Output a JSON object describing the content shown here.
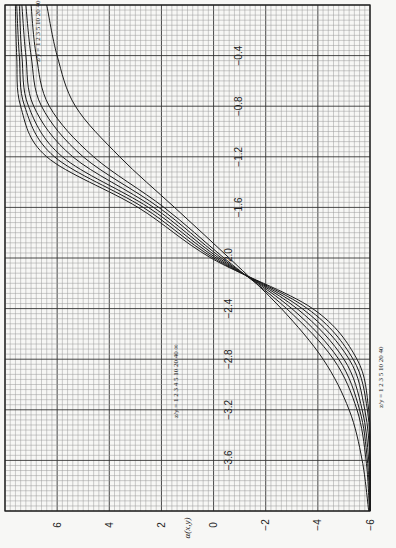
{
  "chart_data": {
    "type": "line",
    "orientation": "rotated-90-ccw",
    "title": "",
    "xlabel": "x",
    "ylabel": "α(x,y)",
    "xlim": [
      0,
      -4.0
    ],
    "ylim": [
      -6,
      8
    ],
    "x_ticks": [
      -0.4,
      -0.8,
      -1.2,
      -1.6,
      -2.0,
      -2.4,
      -2.8,
      -3.2,
      -3.6
    ],
    "x_tick_labels": [
      "−0.4",
      "−0.8",
      "−1.2",
      "−1.6",
      "−2.0",
      "−2.4",
      "−2.8",
      "−3.2",
      "−3.6"
    ],
    "y_ticks": [
      6,
      4,
      2,
      0,
      -2,
      -4,
      -6
    ],
    "y_tick_labels": [
      "6",
      "4",
      "2",
      "0",
      "−2",
      "−4",
      "−6"
    ],
    "grid": true,
    "legend_top": "z/y = 1  2  3  5  10  20  40",
    "legend_bottom": "z/y = 1  2  3  5  10  20  40",
    "legend_inner": "z/y = 1 2 3 4 5 10 20 40 ∞",
    "series": [
      {
        "name": "z/y=1",
        "x": [
          0,
          -0.4,
          -0.8,
          -1.2,
          -1.6,
          -2.0,
          -2.4,
          -2.8,
          -3.2,
          -3.6,
          -4.0
        ],
        "values": [
          6.4,
          6.0,
          5.3,
          3.6,
          1.5,
          -0.6,
          -2.6,
          -4.2,
          -5.2,
          -5.7,
          -5.95
        ]
      },
      {
        "name": "z/y=2",
        "x": [
          0,
          -0.4,
          -0.8,
          -1.2,
          -1.6,
          -2.0,
          -2.4,
          -2.8,
          -3.2,
          -3.6,
          -4.0
        ],
        "values": [
          7.0,
          6.8,
          6.3,
          4.6,
          1.9,
          -0.4,
          -2.8,
          -4.6,
          -5.5,
          -5.85,
          -5.98
        ]
      },
      {
        "name": "z/y=3",
        "x": [
          0,
          -0.4,
          -0.8,
          -1.2,
          -1.6,
          -2.0,
          -2.4,
          -2.8,
          -3.2,
          -3.6,
          -4.0
        ],
        "values": [
          7.2,
          7.0,
          6.6,
          5.0,
          2.1,
          -0.3,
          -3.0,
          -4.8,
          -5.6,
          -5.9,
          -6.0
        ]
      },
      {
        "name": "z/y=5",
        "x": [
          0,
          -0.4,
          -0.8,
          -1.2,
          -1.6,
          -2.0,
          -2.4,
          -2.8,
          -3.2,
          -3.6,
          -4.0
        ],
        "values": [
          7.35,
          7.2,
          6.9,
          5.4,
          2.3,
          -0.2,
          -3.2,
          -5.0,
          -5.7,
          -5.95,
          -6.0
        ]
      },
      {
        "name": "z/y=10",
        "x": [
          0,
          -0.4,
          -0.8,
          -1.2,
          -1.6,
          -2.0,
          -2.4,
          -2.8,
          -3.2,
          -3.6,
          -4.0
        ],
        "values": [
          7.45,
          7.35,
          7.1,
          5.8,
          2.5,
          -0.1,
          -3.4,
          -5.2,
          -5.8,
          -6.0,
          -6.0
        ]
      },
      {
        "name": "z/y=20",
        "x": [
          0,
          -0.4,
          -0.8,
          -1.2,
          -1.6,
          -2.0,
          -2.4,
          -2.8,
          -3.2,
          -3.6,
          -4.0
        ],
        "values": [
          7.55,
          7.45,
          7.25,
          6.1,
          2.7,
          0.0,
          -3.6,
          -5.35,
          -5.9,
          -6.0,
          -6.0
        ]
      },
      {
        "name": "z/y=40",
        "x": [
          0,
          -0.4,
          -0.8,
          -1.2,
          -1.6,
          -2.0,
          -2.4,
          -2.8,
          -3.2,
          -3.6,
          -4.0
        ],
        "values": [
          7.6,
          7.55,
          7.4,
          6.4,
          2.9,
          0.1,
          -3.8,
          -5.5,
          -5.95,
          -6.0,
          -6.0
        ]
      }
    ]
  }
}
